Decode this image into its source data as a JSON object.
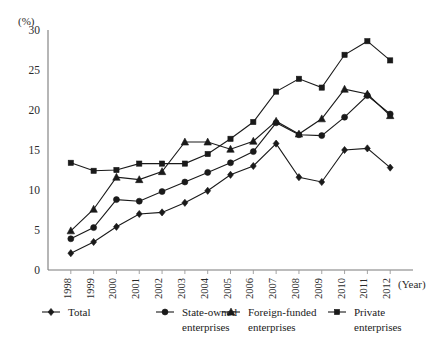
{
  "chart_data": {
    "type": "line",
    "title": "",
    "subtitle": "",
    "xlabel": "(Year)",
    "ylabel": "(%)",
    "categories": [
      "1998",
      "1999",
      "2000",
      "2001",
      "2002",
      "2003",
      "2004",
      "2005",
      "2006",
      "2007",
      "2008",
      "2009",
      "2010",
      "2011",
      "2012"
    ],
    "x": [
      1998,
      1999,
      2000,
      2001,
      2002,
      2003,
      2004,
      2005,
      2006,
      2007,
      2008,
      2009,
      2010,
      2011,
      2012
    ],
    "ylim": [
      0,
      30
    ],
    "yticks": [
      0,
      5,
      10,
      15,
      20,
      25,
      30
    ],
    "ytick_labels": [
      "0",
      "5",
      "10",
      "15",
      "20",
      "25",
      "30"
    ],
    "grid": false,
    "legend_position": "below",
    "series": [
      {
        "name": "Total",
        "marker": "diamond",
        "values": [
          2.1,
          3.5,
          5.4,
          7.0,
          7.2,
          8.4,
          9.9,
          11.9,
          13.0,
          15.8,
          11.6,
          11.0,
          15.0,
          15.2,
          12.8
        ]
      },
      {
        "name": "State-owned enterprises",
        "marker": "circle",
        "values": [
          3.9,
          5.3,
          8.8,
          8.6,
          9.8,
          11.0,
          12.2,
          13.4,
          14.8,
          18.4,
          16.9,
          16.8,
          19.1,
          21.8,
          19.5
        ]
      },
      {
        "name": "Foreign-funded enterprises",
        "marker": "triangle",
        "values": [
          4.9,
          7.6,
          11.6,
          11.3,
          12.3,
          16.0,
          16.0,
          15.1,
          16.1,
          18.6,
          17.0,
          18.9,
          22.6,
          22.0,
          19.3
        ]
      },
      {
        "name": "Private enterprises",
        "marker": "square",
        "values": [
          13.4,
          12.4,
          12.5,
          13.3,
          13.3,
          13.3,
          14.5,
          16.4,
          18.5,
          22.3,
          23.9,
          22.8,
          26.9,
          28.6,
          26.2
        ]
      }
    ]
  },
  "axis": {
    "y_unit_label": "(%)",
    "x_unit_label": "(Year)"
  },
  "legend": {
    "items": [
      {
        "label_line1": "Total",
        "label_line2": "",
        "marker": "diamond"
      },
      {
        "label_line1": "State-owned",
        "label_line2": "enterprises",
        "marker": "circle"
      },
      {
        "label_line1": "Foreign-funded",
        "label_line2": "enterprises",
        "marker": "triangle"
      },
      {
        "label_line1": "Private",
        "label_line2": "enterprises",
        "marker": "square"
      }
    ]
  },
  "style": {
    "line_color": "#1a1a1a",
    "axis_color": "#7a7a7a",
    "background": "#ffffff"
  }
}
